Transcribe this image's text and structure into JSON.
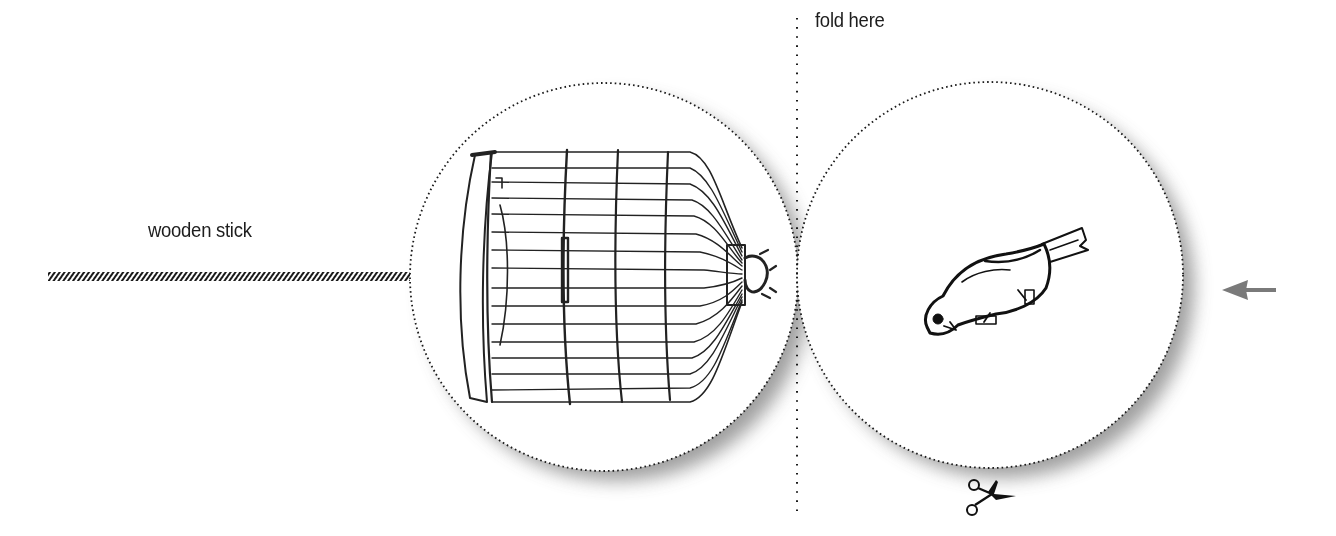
{
  "labels": {
    "fold": "fold here",
    "stick": "wooden stick"
  },
  "illustration": {
    "title": "Thaumatrope template: bird and birdcage",
    "left_disc": {
      "content": "birdcage drawing",
      "center": [
        604,
        277
      ],
      "radius": 194
    },
    "right_disc": {
      "content": "bird drawing",
      "center": [
        990,
        275
      ],
      "radius": 193
    },
    "fold_line_x": 797,
    "stick": {
      "x_start": 48,
      "x_end": 410,
      "y": 277
    },
    "icons": [
      "scissors-icon",
      "arrow-left-icon"
    ]
  },
  "colors": {
    "ink": "#1a1a1a",
    "arrow": "#7a7a7a",
    "shadow": "#9a9a9a",
    "background": "#ffffff"
  }
}
